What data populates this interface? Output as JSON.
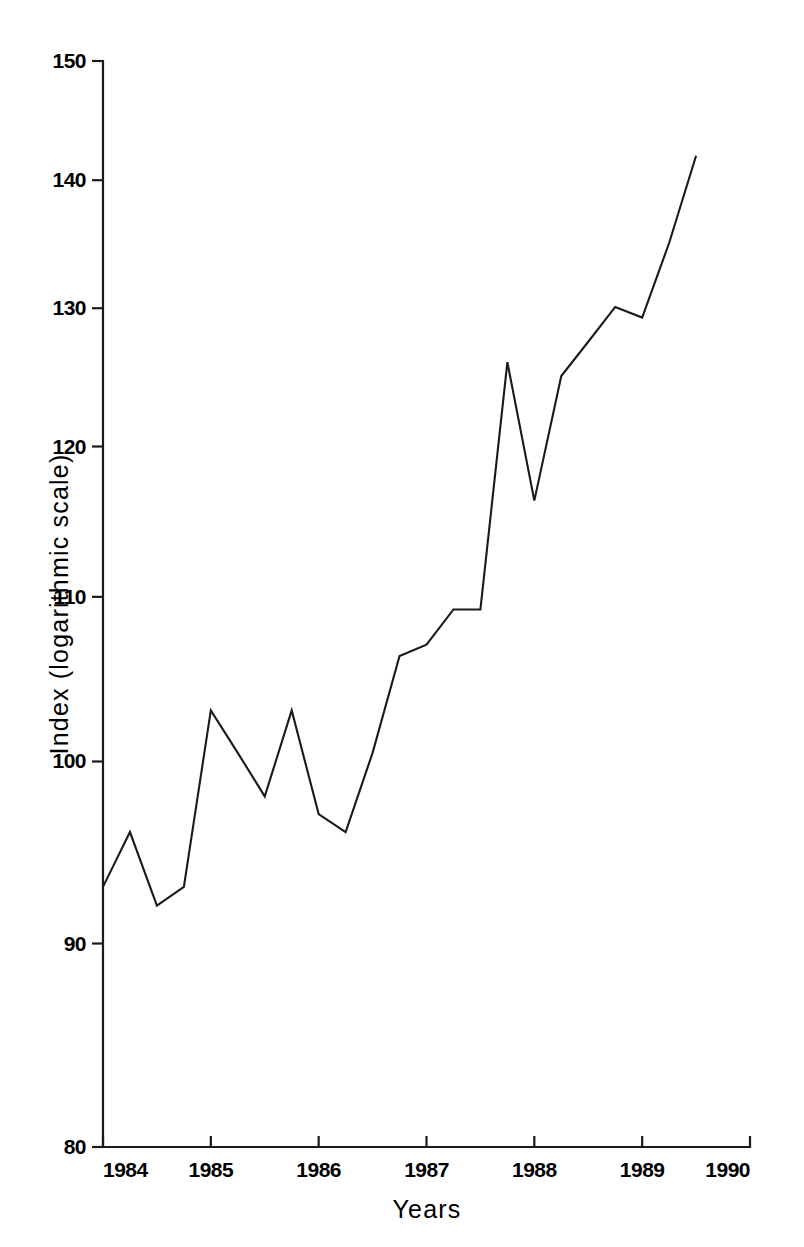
{
  "chart_data": {
    "type": "line",
    "title": "",
    "subtitle": "",
    "xlabel": "Years",
    "ylabel": "Index (logarithmic scale)",
    "yscale": "log",
    "ylim": [
      80,
      150
    ],
    "xlim": [
      1984.0,
      1990.0
    ],
    "grid": false,
    "legend": null,
    "y_ticks": [
      80,
      90,
      100,
      110,
      120,
      130,
      140,
      150
    ],
    "y_tick_labels": [
      "80",
      "90",
      "100",
      "110",
      "120",
      "130",
      "140",
      "150"
    ],
    "x_ticks": [
      1984,
      1985,
      1986,
      1987,
      1988,
      1989,
      1990
    ],
    "x_tick_labels": [
      "1984",
      "1985",
      "1986",
      "1987",
      "1988",
      "1989",
      "1990"
    ],
    "series": [
      {
        "name": "Index",
        "color": "#1a1a1a",
        "x": [
          1984.0,
          1984.25,
          1984.5,
          1984.75,
          1985.0,
          1985.25,
          1985.5,
          1985.75,
          1986.0,
          1986.25,
          1986.5,
          1986.75,
          1987.0,
          1987.25,
          1987.5,
          1987.75,
          1988.0,
          1988.25,
          1988.5,
          1988.75,
          1989.0,
          1989.25,
          1989.5
        ],
        "values": [
          93.0,
          96.0,
          92.0,
          93.0,
          103.0,
          100.5,
          98.0,
          103.0,
          97.0,
          96.0,
          100.5,
          106.3,
          107.0,
          109.2,
          109.2,
          126.0,
          116.3,
          125.0,
          127.5,
          130.1,
          129.3,
          135.0,
          142.0
        ]
      }
    ]
  },
  "axes": {
    "y_axis_label": "Index (logarithmic scale)",
    "x_axis_label": "Years"
  }
}
